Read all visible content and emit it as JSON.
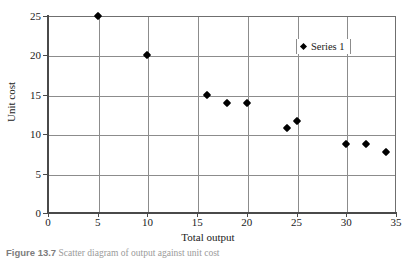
{
  "chart_data": {
    "type": "scatter",
    "title": "",
    "xlabel": "Total output",
    "ylabel": "Unit cost",
    "xlim": [
      0,
      35
    ],
    "ylim": [
      0,
      25
    ],
    "xticks": [
      0,
      5,
      10,
      15,
      20,
      25,
      30,
      35
    ],
    "yticks": [
      0,
      5,
      10,
      15,
      20,
      25
    ],
    "xtick_labels": [
      "0",
      "5",
      "10",
      "15",
      "20",
      "25",
      "30",
      "35"
    ],
    "ytick_labels": [
      "0",
      "5",
      "10",
      "15",
      "20",
      "25"
    ],
    "grid": true,
    "legend_position": "top-right",
    "series": [
      {
        "name": "Series 1",
        "marker": "diamond",
        "color": "#000000",
        "points": [
          {
            "x": 5,
            "y": 25.0
          },
          {
            "x": 10,
            "y": 20.0
          },
          {
            "x": 16,
            "y": 15.0
          },
          {
            "x": 18,
            "y": 13.9
          },
          {
            "x": 20,
            "y": 13.9
          },
          {
            "x": 24,
            "y": 10.8
          },
          {
            "x": 25,
            "y": 11.7
          },
          {
            "x": 30,
            "y": 8.8
          },
          {
            "x": 32,
            "y": 8.8
          },
          {
            "x": 34,
            "y": 7.8
          }
        ]
      }
    ]
  },
  "legend": {
    "entry_label": "Series 1",
    "marker_icon": "diamond-marker-icon"
  },
  "caption": {
    "number": "Figure 13.7",
    "text": "Scatter diagram of output against unit cost"
  },
  "colors": {
    "marker": "#000000",
    "gridline": "#8c8c8c",
    "axis": "#4a4a4a",
    "text": "#1a1a1a",
    "caption": "#9a9a9a"
  }
}
